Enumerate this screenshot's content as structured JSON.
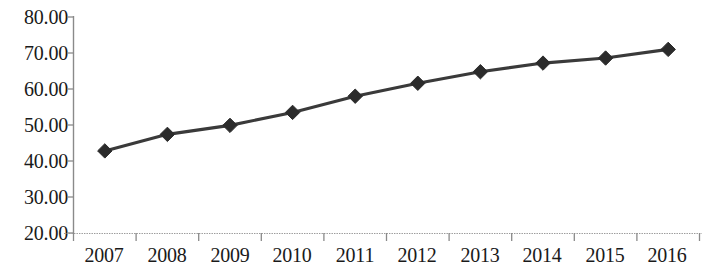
{
  "chart_data": {
    "type": "line",
    "title": "",
    "subtitle": "",
    "xlabel": "",
    "ylabel": "",
    "categories": [
      "2007",
      "2008",
      "2009",
      "2010",
      "2011",
      "2012",
      "2013",
      "2014",
      "2015",
      "2016"
    ],
    "values": [
      42.8,
      47.4,
      49.9,
      53.5,
      58.0,
      61.6,
      64.8,
      67.2,
      68.6,
      71.0
    ],
    "series": [
      {
        "name": "",
        "values": [
          42.8,
          47.4,
          49.9,
          53.5,
          58.0,
          61.6,
          64.8,
          67.2,
          68.6,
          71.0
        ]
      }
    ],
    "ylim": [
      20.0,
      80.0
    ],
    "ytick_step": 10.0,
    "ytick_labels": [
      "80.00",
      "70.00",
      "60.00",
      "50.00",
      "40.00",
      "30.00",
      "20.00"
    ],
    "ytick_values": [
      80.0,
      70.0,
      60.0,
      50.0,
      40.0,
      30.0,
      20.0
    ],
    "xtick_labels": [
      "2007",
      "2008",
      "2009",
      "2010",
      "2011",
      "2012",
      "2013",
      "2014",
      "2015",
      "2016"
    ],
    "grid": false,
    "legend": false,
    "legend_position": "none",
    "marker": "diamond",
    "line_color": "#3a3a3a",
    "marker_color": "#2b2b2b",
    "axis_color": "#8a8a8a",
    "text_color": "#1a1a1a",
    "background_color": "#ffffff",
    "annotations": []
  },
  "axes": {
    "y_label_0": "80.00",
    "y_label_1": "70.00",
    "y_label_2": "60.00",
    "y_label_3": "50.00",
    "y_label_4": "40.00",
    "y_label_5": "30.00",
    "y_label_6": "20.00",
    "x_label_0": "2007",
    "x_label_1": "2008",
    "x_label_2": "2009",
    "x_label_3": "2010",
    "x_label_4": "2011",
    "x_label_5": "2012",
    "x_label_6": "2013",
    "x_label_7": "2014",
    "x_label_8": "2015",
    "x_label_9": "2016"
  }
}
